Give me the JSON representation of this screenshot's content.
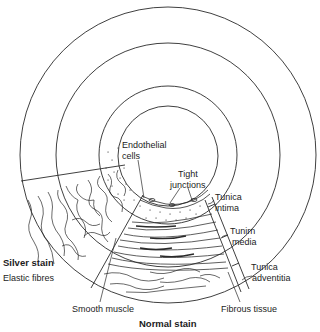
{
  "diagram": {
    "type": "cross-section",
    "colors": {
      "line": "#2a2a2a",
      "text": "#1c1c1c",
      "background": "#ffffff"
    },
    "labels": {
      "endothelial_line1": "Endothelial",
      "endothelial_line2": "cells",
      "tight_line1": "Tight",
      "tight_line2": "junctions",
      "intima_line1": "Tunica",
      "intima_line2": "intima",
      "media_line1": "Tunirn",
      "media_line2": "media",
      "adventitia_line1": "Tunica",
      "adventitia_line2": "adventitia",
      "silver_stain": "Silver stain",
      "elastic_fibres": "Elastic fibres",
      "smooth_muscle": "Smooth muscle",
      "normal_stain": "Normal stain",
      "fibrous_tissue": "Fibrous tissue"
    },
    "circles": [
      {
        "name": "lumen",
        "r": 50
      },
      {
        "name": "intima-outer",
        "r": 69
      },
      {
        "name": "media-outer",
        "r": 112
      },
      {
        "name": "adventitia-outer",
        "r": 148
      }
    ]
  }
}
